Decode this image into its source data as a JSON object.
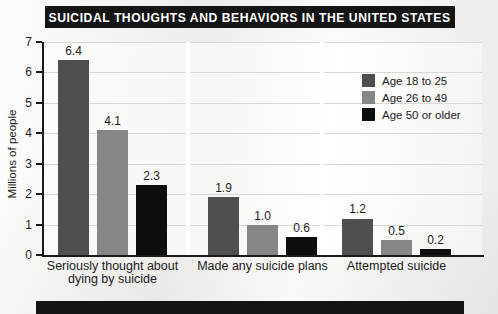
{
  "title": "SUICIDAL THOUGHTS AND BEHAVIORS IN THE UNITED STATES",
  "colors": {
    "series_18_25": "#4f4f4f",
    "series_26_49": "#868686",
    "series_50_plus": "#0d0d0d",
    "banner_bg": "#151515",
    "axis": "#1b1b1b",
    "gridline": "#d8d8d5",
    "plot_bg": "#fbfbfa"
  },
  "chart_data": {
    "type": "bar",
    "title": "SUICIDAL THOUGHTS AND BEHAVIORS IN THE UNITED STATES",
    "xlabel": "",
    "ylabel": "Millions of people",
    "ylim": [
      0,
      7
    ],
    "yticks": [
      0,
      1,
      2,
      3,
      4,
      5,
      6,
      7
    ],
    "ytick_labels": [
      "0",
      "1",
      "2",
      "3",
      "4",
      "5",
      "6",
      "7"
    ],
    "grid": true,
    "legend_position": "top-right",
    "categories": [
      "Seriously thought about dying by suicide",
      "Made any suicide plans",
      "Attempted suicide"
    ],
    "category_lines": [
      [
        "Seriously thought about",
        "dying by suicide"
      ],
      [
        "Made any suicide plans"
      ],
      [
        "Attempted suicide"
      ]
    ],
    "series": [
      {
        "name": "Age 18 to 25",
        "color": "#4f4f4f",
        "values": [
          6.4,
          1.9,
          1.2
        ],
        "value_labels": [
          "6.4",
          "1.9",
          "1.2"
        ]
      },
      {
        "name": "Age 26 to 49",
        "color": "#868686",
        "values": [
          4.1,
          1.0,
          0.5
        ],
        "value_labels": [
          "4.1",
          "1.0",
          "0.5"
        ]
      },
      {
        "name": "Age 50 or older",
        "color": "#0d0d0d",
        "values": [
          2.3,
          0.6,
          0.2
        ],
        "value_labels": [
          "2.3",
          "0.6",
          "0.2"
        ]
      }
    ]
  },
  "legend": {
    "items": [
      {
        "label": "Age 18 to 25",
        "color": "#4f4f4f"
      },
      {
        "label": "Age 26 to 49",
        "color": "#868686"
      },
      {
        "label": "Age 50 or older",
        "color": "#0d0d0d"
      }
    ]
  },
  "footer": {
    "text": ""
  }
}
